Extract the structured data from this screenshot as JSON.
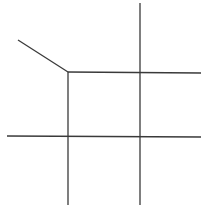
{
  "diagram": {
    "type": "line-diagram",
    "background": "#ffffff",
    "stroke_color": "#3a3a3a",
    "stroke_width": 1.3,
    "segments": [
      {
        "name": "diagonal-segment",
        "x1": 18,
        "y1": 40,
        "x2": 68,
        "y2": 72
      },
      {
        "name": "top-horizontal-line",
        "x1": 68,
        "y1": 72,
        "x2": 201,
        "y2": 73
      },
      {
        "name": "bottom-horizontal-line",
        "x1": 7,
        "y1": 136,
        "x2": 201,
        "y2": 137
      },
      {
        "name": "left-vertical-line",
        "x1": 68,
        "y1": 72,
        "x2": 68,
        "y2": 205
      },
      {
        "name": "right-vertical-line",
        "x1": 140,
        "y1": 3,
        "x2": 140,
        "y2": 205
      }
    ]
  }
}
